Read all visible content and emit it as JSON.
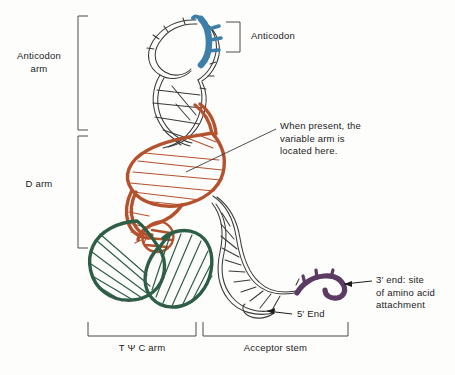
{
  "figure": {
    "background_color": "#fdfdfc"
  },
  "colors": {
    "anticodon_blue": "#3d7fa8",
    "d_arm_rust": "#b5522e",
    "tpsic_arm_green": "#2e5e46",
    "acceptor_end_purple": "#5b3a63",
    "backbone_outline": "#3a3a3a",
    "label_text": "#1b1b1b",
    "bracket_line": "#4a4a4a"
  },
  "labels": {
    "anticodon_arm": "Anticodon\narm",
    "d_arm": "D arm",
    "anticodon": "Anticodon",
    "variable_arm_note": "When present, the\nvariable arm is\nlocated here.",
    "three_prime_end": "3′ end: site\nof amino acid\nattachment",
    "five_prime_end": "5′ End",
    "tpsic_arm": "T Ψ C arm",
    "acceptor_stem": "Acceptor stem"
  },
  "brackets": [
    {
      "name": "anticodon-arm-bracket",
      "orientation": "left",
      "label": "Anticodon arm"
    },
    {
      "name": "d-arm-bracket",
      "orientation": "left",
      "label": "D arm"
    },
    {
      "name": "anticodon-bracket",
      "orientation": "right",
      "label": "Anticodon"
    },
    {
      "name": "tpsic-arm-bracket",
      "orientation": "bottom",
      "label": "T Ψ C arm"
    },
    {
      "name": "acceptor-stem-bracket",
      "orientation": "bottom",
      "label": "Acceptor stem"
    }
  ],
  "regions": [
    {
      "name": "anticodon-loop",
      "color_key": "anticodon_blue",
      "description": "Blue anticodon triplet at top of anticodon loop"
    },
    {
      "name": "d-arm-helix",
      "color_key": "d_arm_rust",
      "description": "Rust-colored D arm helix through the core"
    },
    {
      "name": "tpsic-arm-helix",
      "color_key": "tpsic_arm_green",
      "description": "Dark green T psi C arm loop at lower left"
    },
    {
      "name": "acceptor-stem-helix",
      "color_key": "backbone_outline",
      "description": "Outlined white double helix forming the acceptor stem"
    },
    {
      "name": "three-prime-terminus",
      "color_key": "acceptor_end_purple",
      "description": "Purple CCA 3-prime terminus at far right"
    }
  ]
}
